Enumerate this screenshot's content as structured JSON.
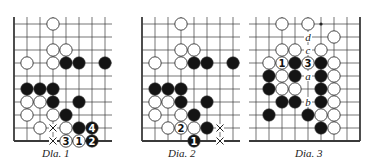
{
  "colors": {
    "line": "#3a3a3a",
    "black_stone": "#141414",
    "white_stone": "#ffffff",
    "stone_outline": "#333333",
    "label": "#222222"
  },
  "grid": {
    "spacing": 13,
    "stone_radius": 6.2
  },
  "diagrams": [
    {
      "caption": "Dla.   1",
      "caption_x": 42,
      "origin_x": 14,
      "origin_y": 24,
      "cols": 8,
      "rows": 10,
      "edges": {
        "left": true,
        "right": false,
        "top": false,
        "bottom": true
      },
      "stones": [
        {
          "c": 3,
          "r": 0,
          "color": "W"
        },
        {
          "c": 3,
          "r": 2,
          "color": "W"
        },
        {
          "c": 4,
          "r": 2,
          "color": "W"
        },
        {
          "c": 1,
          "r": 3,
          "color": "W"
        },
        {
          "c": 3,
          "r": 3,
          "color": "W"
        },
        {
          "c": 4,
          "r": 3,
          "color": "B"
        },
        {
          "c": 5,
          "r": 3,
          "color": "B"
        },
        {
          "c": 7,
          "r": 3,
          "color": "B"
        },
        {
          "c": 1,
          "r": 5,
          "color": "B"
        },
        {
          "c": 2,
          "r": 5,
          "color": "B"
        },
        {
          "c": 3,
          "r": 5,
          "color": "B"
        },
        {
          "c": 1,
          "r": 6,
          "color": "W"
        },
        {
          "c": 2,
          "r": 6,
          "color": "W"
        },
        {
          "c": 3,
          "r": 6,
          "color": "B"
        },
        {
          "c": 5,
          "r": 6,
          "color": "B"
        },
        {
          "c": 1,
          "r": 7,
          "color": "W"
        },
        {
          "c": 3,
          "r": 7,
          "color": "W"
        },
        {
          "c": 4,
          "r": 7,
          "color": "B"
        },
        {
          "c": 2,
          "r": 8,
          "color": "W"
        },
        {
          "c": 4,
          "r": 8,
          "color": "W"
        },
        {
          "c": 5,
          "r": 8,
          "color": "B"
        },
        {
          "c": 6,
          "r": 8,
          "color": "B",
          "label": "4"
        },
        {
          "c": 4,
          "r": 9,
          "color": "W",
          "label": "3"
        },
        {
          "c": 5,
          "r": 9,
          "color": "W",
          "label": "1"
        },
        {
          "c": 6,
          "r": 9,
          "color": "B",
          "label": "2"
        }
      ],
      "marks": [
        {
          "c": 3,
          "r": 8,
          "type": "x"
        },
        {
          "c": 3,
          "r": 9,
          "type": "x"
        }
      ],
      "letters": []
    },
    {
      "caption": "Dia.   2",
      "caption_x": 168,
      "origin_x": 142,
      "origin_y": 24,
      "cols": 8,
      "rows": 10,
      "edges": {
        "left": true,
        "right": false,
        "top": false,
        "bottom": true
      },
      "stones": [
        {
          "c": 3,
          "r": 0,
          "color": "W"
        },
        {
          "c": 3,
          "r": 2,
          "color": "W"
        },
        {
          "c": 4,
          "r": 2,
          "color": "W"
        },
        {
          "c": 1,
          "r": 3,
          "color": "W"
        },
        {
          "c": 3,
          "r": 3,
          "color": "W"
        },
        {
          "c": 4,
          "r": 3,
          "color": "B"
        },
        {
          "c": 5,
          "r": 3,
          "color": "B"
        },
        {
          "c": 7,
          "r": 3,
          "color": "B"
        },
        {
          "c": 1,
          "r": 5,
          "color": "B"
        },
        {
          "c": 2,
          "r": 5,
          "color": "B"
        },
        {
          "c": 3,
          "r": 5,
          "color": "B"
        },
        {
          "c": 1,
          "r": 6,
          "color": "W"
        },
        {
          "c": 2,
          "r": 6,
          "color": "W"
        },
        {
          "c": 3,
          "r": 6,
          "color": "B"
        },
        {
          "c": 5,
          "r": 6,
          "color": "B"
        },
        {
          "c": 1,
          "r": 7,
          "color": "W"
        },
        {
          "c": 3,
          "r": 7,
          "color": "W"
        },
        {
          "c": 4,
          "r": 7,
          "color": "B"
        },
        {
          "c": 2,
          "r": 8,
          "color": "W"
        },
        {
          "c": 3,
          "r": 8,
          "color": "W",
          "label": "2"
        },
        {
          "c": 4,
          "r": 8,
          "color": "W"
        },
        {
          "c": 5,
          "r": 8,
          "color": "B"
        },
        {
          "c": 4,
          "r": 9,
          "color": "B",
          "label": "1"
        }
      ],
      "marks": [
        {
          "c": 6,
          "r": 8,
          "type": "x"
        },
        {
          "c": 6,
          "r": 9,
          "type": "x"
        }
      ],
      "letters": []
    },
    {
      "caption": "Dia.   3",
      "caption_x": 295,
      "origin_x": 256,
      "origin_y": 24,
      "cols": 9,
      "rows": 10,
      "edges": {
        "left": false,
        "right": true,
        "top": false,
        "bottom": true
      },
      "stones": [
        {
          "c": 2,
          "r": 0,
          "color": "W"
        },
        {
          "c": 4,
          "r": 0,
          "color": "W"
        },
        {
          "c": 6,
          "r": 1,
          "color": "W"
        },
        {
          "c": 2,
          "r": 2,
          "color": "W"
        },
        {
          "c": 3,
          "r": 2,
          "color": "W"
        },
        {
          "c": 5,
          "r": 2,
          "color": "W"
        },
        {
          "c": 1,
          "r": 3,
          "color": "W"
        },
        {
          "c": 2,
          "r": 3,
          "color": "W",
          "label": "1"
        },
        {
          "c": 3,
          "r": 3,
          "color": "B"
        },
        {
          "c": 4,
          "r": 3,
          "color": "W",
          "label": "3"
        },
        {
          "c": 5,
          "r": 3,
          "color": "B"
        },
        {
          "c": 6,
          "r": 3,
          "color": "W"
        },
        {
          "c": 1,
          "r": 4,
          "color": "B"
        },
        {
          "c": 2,
          "r": 4,
          "color": "W"
        },
        {
          "c": 3,
          "r": 4,
          "color": "B"
        },
        {
          "c": 5,
          "r": 4,
          "color": "B"
        },
        {
          "c": 6,
          "r": 4,
          "color": "W"
        },
        {
          "c": 1,
          "r": 5,
          "color": "B"
        },
        {
          "c": 2,
          "r": 5,
          "color": "W"
        },
        {
          "c": 3,
          "r": 5,
          "color": "W"
        },
        {
          "c": 5,
          "r": 5,
          "color": "B"
        },
        {
          "c": 6,
          "r": 5,
          "color": "W"
        },
        {
          "c": 2,
          "r": 6,
          "color": "B"
        },
        {
          "c": 3,
          "r": 6,
          "color": "B"
        },
        {
          "c": 5,
          "r": 6,
          "color": "B"
        },
        {
          "c": 6,
          "r": 6,
          "color": "W"
        },
        {
          "c": 1,
          "r": 7,
          "color": "B"
        },
        {
          "c": 4,
          "r": 7,
          "color": "B"
        },
        {
          "c": 5,
          "r": 7,
          "color": "W"
        },
        {
          "c": 6,
          "r": 7,
          "color": "W"
        },
        {
          "c": 5,
          "r": 8,
          "color": "B"
        },
        {
          "c": 6,
          "r": 8,
          "color": "W"
        }
      ],
      "marks": [
        {
          "c": 5,
          "r": 0,
          "type": "dot"
        }
      ],
      "letters": [
        {
          "c": 4,
          "r": 1,
          "text": "d"
        },
        {
          "c": 4,
          "r": 2,
          "text": "c"
        },
        {
          "c": 4,
          "r": 4,
          "text": "a"
        },
        {
          "c": 4,
          "r": 6,
          "text": "b"
        }
      ]
    }
  ]
}
